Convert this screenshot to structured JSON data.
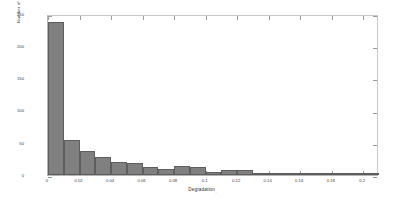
{
  "chart_data": {
    "type": "bar",
    "title": "",
    "xlabel": "Degradation",
    "xlabel_subscript": ",",
    "ylabel": "Number of simulations",
    "xlim": [
      0,
      0.21
    ],
    "ylim": [
      0,
      250
    ],
    "grid": false,
    "legend": null,
    "bin_width": 0.01,
    "bar_color": "#808080",
    "bar_edge_color": "#5e5e5e",
    "axis_color": "#b4b4b4",
    "xticks": [
      0,
      0.02,
      0.04,
      0.06,
      0.08,
      0.1,
      0.12,
      0.14,
      0.16,
      0.18,
      0.2
    ],
    "xticklabels": [
      "0",
      "0.02",
      "0.04",
      "0.06",
      "0.08",
      "0.1",
      "0.12",
      "0.14",
      "0.16",
      "0.18",
      "0.2"
    ],
    "yticks": [
      0,
      50,
      100,
      150,
      200,
      250
    ],
    "yticklabels": [
      "0",
      "50",
      "100",
      "150",
      "200",
      "250"
    ],
    "bins": [
      {
        "x0": 0.0,
        "x1": 0.01,
        "value": 237
      },
      {
        "x0": 0.01,
        "x1": 0.02,
        "value": 55
      },
      {
        "x0": 0.02,
        "x1": 0.03,
        "value": 37
      },
      {
        "x0": 0.03,
        "x1": 0.04,
        "value": 28
      },
      {
        "x0": 0.04,
        "x1": 0.05,
        "value": 20
      },
      {
        "x0": 0.05,
        "x1": 0.06,
        "value": 19
      },
      {
        "x0": 0.06,
        "x1": 0.07,
        "value": 13
      },
      {
        "x0": 0.07,
        "x1": 0.08,
        "value": 10
      },
      {
        "x0": 0.08,
        "x1": 0.09,
        "value": 14
      },
      {
        "x0": 0.09,
        "x1": 0.1,
        "value": 13
      },
      {
        "x0": 0.1,
        "x1": 0.11,
        "value": 5
      },
      {
        "x0": 0.11,
        "x1": 0.12,
        "value": 8
      },
      {
        "x0": 0.12,
        "x1": 0.13,
        "value": 8
      },
      {
        "x0": 0.13,
        "x1": 0.14,
        "value": 1
      },
      {
        "x0": 0.14,
        "x1": 0.15,
        "value": 1
      },
      {
        "x0": 0.15,
        "x1": 0.16,
        "value": 1
      },
      {
        "x0": 0.16,
        "x1": 0.17,
        "value": 2
      },
      {
        "x0": 0.17,
        "x1": 0.18,
        "value": 2
      },
      {
        "x0": 0.18,
        "x1": 0.19,
        "value": 1
      },
      {
        "x0": 0.19,
        "x1": 0.2,
        "value": 1
      },
      {
        "x0": 0.2,
        "x1": 0.21,
        "value": 1
      }
    ]
  }
}
